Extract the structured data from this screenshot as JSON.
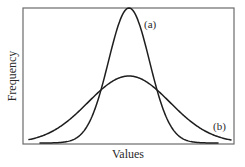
{
  "chart_data": {
    "type": "line",
    "title": "",
    "xlabel": "Values",
    "ylabel": "Frequency",
    "grid": false,
    "legend_position": "inline annotations",
    "x_ticks": [],
    "y_ticks": [],
    "xlim": [
      -5,
      5
    ],
    "ylim": [
      0,
      1
    ],
    "x": [
      -5,
      -4.5,
      -4,
      -3.5,
      -3,
      -2.5,
      -2,
      -1.5,
      -1,
      -0.5,
      0,
      0.5,
      1,
      1.5,
      2,
      2.5,
      3,
      3.5,
      4,
      4.5,
      5
    ],
    "series": [
      {
        "name": "(a)",
        "description": "narrow normal distribution, tall peak",
        "mean": 0,
        "sd": 1,
        "peak": 1.0,
        "values": [
          0.0,
          0.0,
          0.0,
          0.002,
          0.011,
          0.044,
          0.135,
          0.325,
          0.607,
          0.882,
          1.0,
          0.882,
          0.607,
          0.325,
          0.135,
          0.044,
          0.011,
          0.002,
          0.0,
          0.0,
          0.0
        ]
      },
      {
        "name": "(b)",
        "description": "wide normal distribution, low peak",
        "mean": 0,
        "sd": 2,
        "peak": 0.5,
        "values": [
          0.022,
          0.04,
          0.068,
          0.108,
          0.162,
          0.229,
          0.303,
          0.377,
          0.441,
          0.485,
          0.5,
          0.485,
          0.441,
          0.377,
          0.303,
          0.229,
          0.162,
          0.108,
          0.068,
          0.04,
          0.022
        ]
      }
    ],
    "annotations": [
      {
        "text": "(a)",
        "target": "series a",
        "position": "right of peak"
      },
      {
        "text": "(b)",
        "target": "series b",
        "position": "right tail"
      }
    ]
  },
  "labels": {
    "xlabel": "Values",
    "ylabel": "Frequency",
    "curve_a": "(a)",
    "curve_b": "(b)"
  },
  "layout": {
    "plot": {
      "left": 23,
      "top": 8,
      "right": 234,
      "bottom": 144
    },
    "baseline_y": 143,
    "center_x": 129,
    "curve_a": {
      "peak_px": 135,
      "sigma_px": 20.5,
      "x_from": 40,
      "x_to": 218
    },
    "curve_b": {
      "peak_px": 67,
      "sigma_px": 41,
      "x_from": 29,
      "x_to": 231
    }
  }
}
